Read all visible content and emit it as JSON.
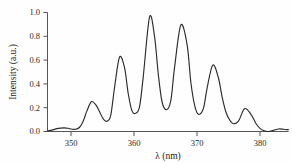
{
  "figure": {
    "background_color": "#fefefe",
    "line_color": "#2b2b2b",
    "axis_color": "#555555"
  },
  "axes": {
    "x_title": "λ (nm)",
    "y_title": "Intensity (a.u.)",
    "x_ticks": [
      "350",
      "360",
      "370",
      "380"
    ],
    "y_ticks": [
      "0.0",
      "0.2",
      "0.4",
      "0.6",
      "0.8",
      "1.0"
    ]
  },
  "chart_data": {
    "type": "line",
    "title": "",
    "xlabel": "λ (nm)",
    "ylabel": "Intensity (a.u.)",
    "xlim": [
      345.5,
      384.0
    ],
    "ylim": [
      0.0,
      1.04
    ],
    "xticks": [
      350,
      360,
      370,
      380
    ],
    "yticks": [
      0.0,
      0.2,
      0.4,
      0.6,
      0.8,
      1.0
    ],
    "grid": false,
    "legend": "none",
    "series": [
      {
        "name": "Fluorescence spectrum",
        "x": [
          345.5,
          346.2,
          347.0,
          347.6,
          348.2,
          348.8,
          349.4,
          350.0,
          350.6,
          351.2,
          351.8,
          352.5,
          353.2,
          353.8,
          354.4,
          355.0,
          355.6,
          356.2,
          357.0,
          357.8,
          358.4,
          359.0,
          359.6,
          360.2,
          360.8,
          361.8,
          362.6,
          363.2,
          363.8,
          364.5,
          365.2,
          365.8,
          366.8,
          367.8,
          368.4,
          369.0,
          369.6,
          370.4,
          371.0,
          371.9,
          372.8,
          373.4,
          374.0,
          374.6,
          375.2,
          376.0,
          377.0,
          378.0,
          378.8,
          379.4,
          380.0,
          380.8,
          381.6,
          382.4,
          383.2,
          384.0
        ],
        "y": [
          0.005,
          0.012,
          0.025,
          0.03,
          0.032,
          0.028,
          0.02,
          0.02,
          0.035,
          0.09,
          0.18,
          0.26,
          0.235,
          0.175,
          0.11,
          0.09,
          0.14,
          0.38,
          0.65,
          0.56,
          0.33,
          0.18,
          0.16,
          0.215,
          0.48,
          1.0,
          0.83,
          0.5,
          0.26,
          0.19,
          0.27,
          0.56,
          0.93,
          0.76,
          0.43,
          0.23,
          0.15,
          0.2,
          0.38,
          0.58,
          0.47,
          0.3,
          0.17,
          0.1,
          0.068,
          0.09,
          0.2,
          0.15,
          0.07,
          0.03,
          0.008,
          0.0,
          0.01,
          0.022,
          0.02,
          0.015
        ]
      }
    ],
    "peaks": [
      {
        "x": 348.2,
        "y": 0.032
      },
      {
        "x": 352.5,
        "y": 0.26
      },
      {
        "x": 357.0,
        "y": 0.65
      },
      {
        "x": 361.8,
        "y": 1.0
      },
      {
        "x": 366.8,
        "y": 0.93
      },
      {
        "x": 371.9,
        "y": 0.58
      },
      {
        "x": 377.0,
        "y": 0.2
      }
    ],
    "valleys": [
      {
        "x": 349.4,
        "y": 0.02
      },
      {
        "x": 355.0,
        "y": 0.09
      },
      {
        "x": 359.6,
        "y": 0.16
      },
      {
        "x": 364.5,
        "y": 0.19
      },
      {
        "x": 369.6,
        "y": 0.15
      },
      {
        "x": 375.2,
        "y": 0.068
      },
      {
        "x": 380.8,
        "y": 0.0
      }
    ]
  }
}
